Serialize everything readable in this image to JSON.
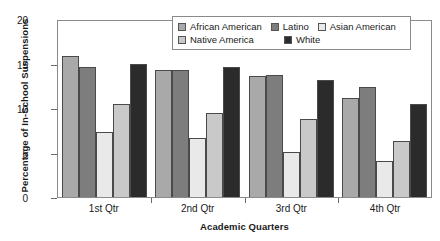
{
  "chart_data": {
    "type": "bar",
    "title": "",
    "xlabel": "Academic Quarters",
    "ylabel": "Percentage of In-School Suspensions",
    "categories": [
      "1st Qtr",
      "2nd Qtr",
      "3rd Qtr",
      "4th Qtr"
    ],
    "ylim": [
      0,
      20
    ],
    "yticks": [
      0,
      5,
      10,
      15,
      20
    ],
    "grid": false,
    "legend_position": "top-right-inside",
    "series": [
      {
        "name": "African American",
        "color": "#a9a9a9",
        "values": [
          15.8,
          14.3,
          13.6,
          11.1
        ]
      },
      {
        "name": "Latino",
        "color": "#7d7d7d",
        "values": [
          14.6,
          14.3,
          13.7,
          12.4
        ]
      },
      {
        "name": "Asian American",
        "color": "#e9e9e9",
        "values": [
          7.3,
          6.6,
          5.1,
          4.1
        ]
      },
      {
        "name": "Native America",
        "color": "#c9c9c9",
        "values": [
          10.4,
          9.4,
          8.8,
          6.3
        ]
      },
      {
        "name": "White",
        "color": "#2b2b2b",
        "values": [
          14.9,
          14.6,
          13.2,
          10.5
        ]
      }
    ],
    "legend_order": [
      "African American",
      "Latino",
      "Asian American",
      "Native America",
      "White"
    ],
    "series_draw_order": [
      "African American",
      "Latino",
      "Asian American",
      "Native America",
      "White"
    ]
  }
}
